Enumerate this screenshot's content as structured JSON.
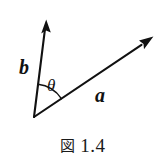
{
  "figure": {
    "caption_label": "図",
    "caption_number": "1.4",
    "background_color": "#ffffff",
    "ink_color": "#111111"
  },
  "diagram": {
    "type": "vector-angle-diagram",
    "origin": {
      "x": 34,
      "y": 117
    },
    "vectors": [
      {
        "name": "b",
        "label": "b",
        "label_style": "bold-italic",
        "tip": {
          "x": 46,
          "y": 21
        },
        "angle_degrees_from_positive_x_axis": 82.9
      },
      {
        "name": "a",
        "label": "a",
        "label_style": "bold-italic",
        "tip": {
          "x": 153,
          "y": 37
        },
        "angle_degrees_from_positive_x_axis": 33.9
      }
    ],
    "angle_arc": {
      "label": "θ",
      "label_style": "italic",
      "radius": 33,
      "between": [
        "a",
        "b"
      ],
      "sweep_degrees": 49
    }
  }
}
